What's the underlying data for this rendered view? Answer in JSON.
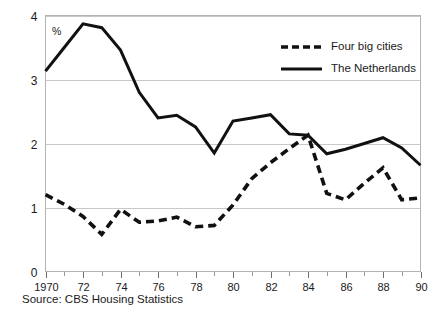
{
  "chart_data": {
    "type": "line",
    "title": "",
    "subtitle": "",
    "xlabel": "",
    "ylabel": "%",
    "unit_label": "%",
    "xlim": [
      1970,
      1990
    ],
    "ylim": [
      0,
      4
    ],
    "grid": true,
    "gridlines_y": [
      1,
      2,
      3,
      4
    ],
    "legend_position": "top-right",
    "source": "Source: CBS Housing Statistics",
    "x": [
      1970,
      1971,
      1972,
      1973,
      1974,
      1975,
      1976,
      1977,
      1978,
      1979,
      1980,
      1981,
      1982,
      1983,
      1984,
      1985,
      1986,
      1987,
      1988,
      1989,
      1990
    ],
    "xtick_labels": [
      "1970",
      "",
      "72",
      "",
      "74",
      "",
      "76",
      "",
      "78",
      "",
      "80",
      "",
      "82",
      "",
      "84",
      "",
      "86",
      "",
      "88",
      "",
      "90"
    ],
    "ytick_labels": [
      "0",
      "1",
      "2",
      "3",
      "4"
    ],
    "ytick_values": [
      0,
      1,
      2,
      3,
      4
    ],
    "series": [
      {
        "name": "Four big cities",
        "style": "dashed",
        "color": "#111111",
        "values": [
          1.2,
          1.05,
          0.86,
          0.58,
          0.97,
          0.77,
          0.79,
          0.85,
          0.7,
          0.72,
          1.04,
          1.45,
          1.7,
          1.92,
          2.13,
          1.22,
          1.12,
          1.38,
          1.62,
          1.12,
          1.15
        ]
      },
      {
        "name": "The Netherlands",
        "style": "solid",
        "color": "#111111",
        "values": [
          3.13,
          3.5,
          3.87,
          3.81,
          3.46,
          2.8,
          2.4,
          2.44,
          2.26,
          1.85,
          2.35,
          2.4,
          2.45,
          2.15,
          2.13,
          1.84,
          1.91,
          2.0,
          2.09,
          1.93,
          1.66
        ]
      }
    ]
  },
  "legend": {
    "items": [
      {
        "label": "Four big cities",
        "style": "dashed"
      },
      {
        "label": "The Netherlands",
        "style": "solid"
      }
    ]
  },
  "footer": {
    "source": "Source: CBS Housing Statistics"
  },
  "axes": {
    "y_unit": "%"
  },
  "colors": {
    "series": "#111111",
    "grid": "#c8c8c8",
    "frame": "#b4b4b4",
    "text": "#1a1a1a",
    "background": "#ffffff"
  }
}
